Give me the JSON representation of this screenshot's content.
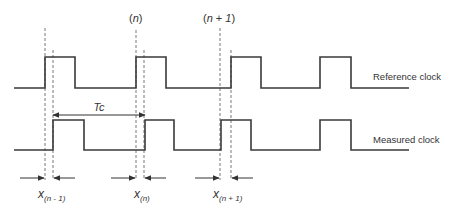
{
  "title_labels": {
    "n": "(n)",
    "n_plus_1": "(n + 1)"
  },
  "signals": {
    "reference": {
      "label": "Reference clock",
      "low_y": 88,
      "high_y": 57,
      "start_x": 14,
      "end_x": 409,
      "pulses": [
        [
          45,
          75
        ],
        [
          136,
          166
        ],
        [
          231,
          261
        ],
        [
          320,
          351
        ]
      ]
    },
    "measured": {
      "label": "Measured clock",
      "low_y": 150,
      "high_y": 120,
      "start_x": 14,
      "end_x": 409,
      "pulses": [
        [
          53,
          84
        ],
        [
          145,
          174
        ],
        [
          221,
          251
        ],
        [
          320,
          351
        ]
      ]
    }
  },
  "period": {
    "label": "Tc",
    "from_x": 53,
    "to_x": 145,
    "y": 115
  },
  "dashed_lines": [
    {
      "x": 45,
      "y1": 28,
      "y2": 180
    },
    {
      "x": 53,
      "y1": 50,
      "y2": 180
    },
    {
      "x": 136,
      "y1": 30,
      "y2": 180
    },
    {
      "x": 144,
      "y1": 50,
      "y2": 180
    },
    {
      "x": 220,
      "y1": 28,
      "y2": 180
    },
    {
      "x": 231,
      "y1": 50,
      "y2": 180
    }
  ],
  "offsets": [
    {
      "label_main": "x",
      "label_sub": "(n - 1)",
      "left_x": 45,
      "right_x": 53,
      "label_x": 38
    },
    {
      "label_main": "x",
      "label_sub": "(n)",
      "left_x": 136,
      "right_x": 144,
      "label_x": 134
    },
    {
      "label_main": "x",
      "label_sub": "(n + 1)",
      "left_x": 220,
      "right_x": 231,
      "label_x": 213
    }
  ]
}
